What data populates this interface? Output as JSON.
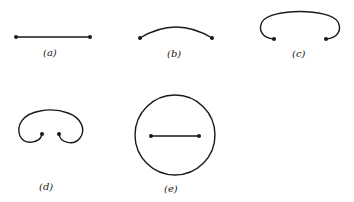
{
  "figure": {
    "panels": [
      {
        "id": "a",
        "label": "(a)",
        "description": "straight segment between two endpoints"
      },
      {
        "id": "b",
        "label": "(b)",
        "description": "shallow arc between two endpoints"
      },
      {
        "id": "c",
        "label": "(c)",
        "description": "curve bent into an open loop with endpoints facing inward"
      },
      {
        "id": "d",
        "label": "(d)",
        "description": "curve curled further with endpoints nearly touching"
      },
      {
        "id": "e",
        "label": "(e)",
        "description": "closed circle enclosing a straight segment between two endpoints"
      }
    ]
  }
}
